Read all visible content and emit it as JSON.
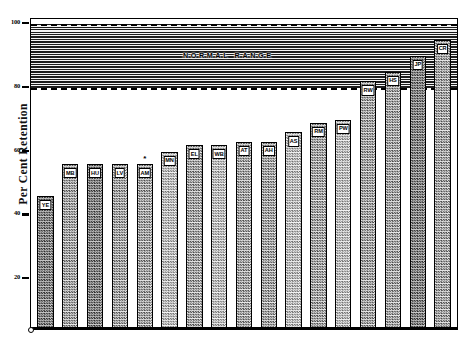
{
  "chart_data": {
    "type": "bar",
    "title": "",
    "xlabel": "",
    "ylabel": "Per Cent Retention",
    "ylim": [
      0,
      105
    ],
    "yticks": [
      100,
      80,
      60,
      40,
      20
    ],
    "ytick_labels": [
      "100",
      "80",
      "60",
      "40",
      "20"
    ],
    "grid": false,
    "legend": null,
    "categories": [
      "YE",
      "MB",
      "HU",
      "LV",
      "AM",
      "MN",
      "EL",
      "WB",
      "AT",
      "AH",
      "AS",
      "RM",
      "PW",
      "RW",
      "HS",
      "JP",
      "CR"
    ],
    "values": [
      46,
      56,
      56,
      56,
      56,
      60,
      62,
      62,
      63,
      63,
      66,
      69,
      70,
      82,
      85,
      90,
      95
    ],
    "annotations": [
      {
        "label": "NORMAL RANGE",
        "type": "band-label",
        "y_range": [
          80,
          100
        ]
      },
      {
        "label": "*",
        "type": "marker",
        "category": "AM"
      }
    ],
    "shaded_band": {
      "label": "NORMAL RANGE",
      "lower": 80,
      "upper": 100,
      "style": "horizontal-hatch",
      "boundary_style": "dashed"
    }
  },
  "axis": {
    "y_title": "Per Cent Retention",
    "ticks": [
      {
        "value": 100,
        "label": "100"
      },
      {
        "value": 80,
        "label": "80"
      },
      {
        "value": 60,
        "label": "60"
      },
      {
        "value": 40,
        "label": "40"
      },
      {
        "value": 20,
        "label": "20"
      }
    ]
  },
  "band": {
    "label": "NORMAL RANGE"
  },
  "bars": [
    {
      "label": "YE",
      "value": 46,
      "shade": "dk",
      "star": false
    },
    {
      "label": "MB",
      "value": 56,
      "shade": "mid",
      "star": false
    },
    {
      "label": "HU",
      "value": 56,
      "shade": "dk",
      "star": false
    },
    {
      "label": "LV",
      "value": 56,
      "shade": "mid",
      "star": false
    },
    {
      "label": "AM",
      "value": 56,
      "shade": "mid",
      "star": true
    },
    {
      "label": "MN",
      "value": 60,
      "shade": "lt",
      "star": false
    },
    {
      "label": "EL",
      "value": 62,
      "shade": "mid",
      "star": false
    },
    {
      "label": "WB",
      "value": 62,
      "shade": "lt",
      "star": false
    },
    {
      "label": "AT",
      "value": 63,
      "shade": "mid",
      "star": false
    },
    {
      "label": "AH",
      "value": 63,
      "shade": "mid",
      "star": false
    },
    {
      "label": "AS",
      "value": 66,
      "shade": "lt",
      "star": false
    },
    {
      "label": "RM",
      "value": 69,
      "shade": "mid",
      "star": false
    },
    {
      "label": "PW",
      "value": 70,
      "shade": "lt",
      "star": false
    },
    {
      "label": "RW",
      "value": 82,
      "shade": "mid",
      "star": false
    },
    {
      "label": "HS",
      "value": 85,
      "shade": "mid",
      "star": false
    },
    {
      "label": "JP",
      "value": 90,
      "shade": "dk",
      "star": false
    },
    {
      "label": "CR",
      "value": 95,
      "shade": "mid",
      "star": false
    }
  ]
}
